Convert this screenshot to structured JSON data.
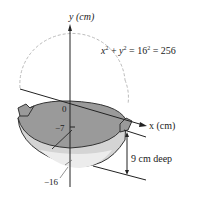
{
  "diagram": {
    "y_axis_label": "y (cm)",
    "x_axis_label": "x (cm)",
    "equation": {
      "x": "x",
      "plus": " + ",
      "y": "y",
      "rest": " = 16",
      "rest2": " = 256",
      "exp": "2"
    },
    "tick_0": "0",
    "tick_neg7": "−7",
    "tick_neg16": "−16",
    "depth_label": "9 cm deep",
    "colors": {
      "wok_inner": "#9a9a9a",
      "wok_outer": "#d4d4d4",
      "wok_bottom": "#ececec",
      "outline": "#333333",
      "circle_dashed": "#bbbbbb"
    }
  }
}
